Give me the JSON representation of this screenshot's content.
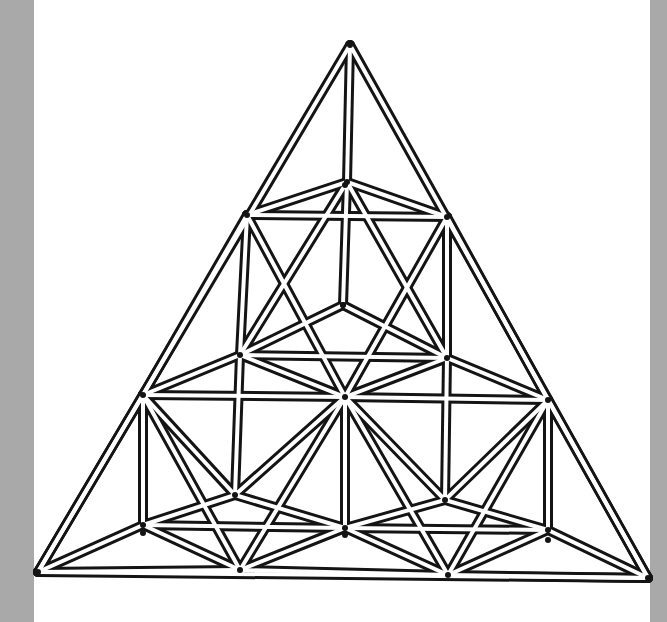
{
  "figure": {
    "title": "",
    "rendering": "double-line (hollow rod) line drawing",
    "colors": {
      "ink": "#141414",
      "paper": "#ffffff",
      "margin": "#a9a9a9"
    }
  },
  "diagram": {
    "levels": 3,
    "nodes": {
      "apex": {
        "role": "apex",
        "level": 0
      },
      "t1": {
        "role": "back",
        "level": 1
      },
      "l1": {
        "role": "left",
        "level": 1
      },
      "r1": {
        "role": "right",
        "level": 1
      },
      "c1": {
        "role": "inner-hub",
        "level": 1
      },
      "t2": {
        "role": "back-center",
        "level": 2
      },
      "l2": {
        "role": "left",
        "level": 2
      },
      "m2": {
        "role": "center",
        "level": 2
      },
      "r2": {
        "role": "right",
        "level": 2
      },
      "bl2": {
        "role": "back-left",
        "level": 2
      },
      "br2": {
        "role": "back-right",
        "level": 2
      },
      "c2": {
        "role": "inner-hub",
        "level": 2
      },
      "l3": {
        "role": "left-corner",
        "level": 3
      },
      "m3a": {
        "role": "base-left-mid",
        "level": 3
      },
      "m3b": {
        "role": "base-right-mid",
        "level": 3
      },
      "r3": {
        "role": "right-corner",
        "level": 3
      },
      "cl3": {
        "role": "inner-hub-left",
        "level": 3
      },
      "cr3": {
        "role": "inner-hub-right",
        "level": 3
      },
      "bl3": {
        "role": "back-left",
        "level": 3
      },
      "bm3": {
        "role": "back-center",
        "level": 3
      },
      "br3": {
        "role": "back-right",
        "level": 3
      },
      "fl3": {
        "role": "front-left",
        "level": 3
      },
      "fr3": {
        "role": "front-right",
        "level": 3
      },
      "bc3": {
        "role": "back-mid-center",
        "level": 3
      }
    }
  }
}
